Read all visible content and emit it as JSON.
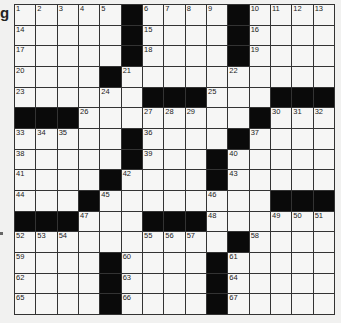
{
  "margin": {
    "text": "g"
  },
  "grid": {
    "rows": 15,
    "cols": 15,
    "layout": [
      "11111011110111 1",
      "x"
    ],
    "pattern": [
      "WWWWW#WWWW#WWWW",
      "WWWWW#WWWW#WWWW",
      "WWWWW#WWWW#WWWW",
      "WWWW#WWWWWWWWWW",
      "WWWWWW###WWW###",
      "###WWWWWWWW#WWW",
      "WWWWW#WWWW#WWWW",
      "WWWWW#WWW#WWWWW",
      "WWWW#WWWW#WWWWW",
      "WWW#WWWWWWWW###",
      "###WWW###WWWWWW",
      "WWWWWWWWWW#WWWW",
      "WWWW#WWWW#WWWWW",
      "WWWW#WWWW#WWWWW",
      "WWWW#WWWW#WWWWW"
    ],
    "numbers": [
      {
        "r": 0,
        "c": 0,
        "n": "1"
      },
      {
        "r": 0,
        "c": 1,
        "n": "2"
      },
      {
        "r": 0,
        "c": 2,
        "n": "3"
      },
      {
        "r": 0,
        "c": 3,
        "n": "4"
      },
      {
        "r": 0,
        "c": 4,
        "n": "5"
      },
      {
        "r": 0,
        "c": 6,
        "n": "6"
      },
      {
        "r": 0,
        "c": 7,
        "n": "7"
      },
      {
        "r": 0,
        "c": 8,
        "n": "8"
      },
      {
        "r": 0,
        "c": 9,
        "n": "9"
      },
      {
        "r": 0,
        "c": 11,
        "n": "10"
      },
      {
        "r": 0,
        "c": 12,
        "n": "11"
      },
      {
        "r": 0,
        "c": 13,
        "n": "12"
      },
      {
        "r": 0,
        "c": 14,
        "n": "13"
      },
      {
        "r": 1,
        "c": 0,
        "n": "14"
      },
      {
        "r": 1,
        "c": 6,
        "n": "15"
      },
      {
        "r": 1,
        "c": 11,
        "n": "16"
      },
      {
        "r": 2,
        "c": 0,
        "n": "17"
      },
      {
        "r": 2,
        "c": 6,
        "n": "18"
      },
      {
        "r": 2,
        "c": 11,
        "n": "19"
      },
      {
        "r": 3,
        "c": 0,
        "n": "20"
      },
      {
        "r": 3,
        "c": 5,
        "n": "21"
      },
      {
        "r": 3,
        "c": 10,
        "n": "22"
      },
      {
        "r": 4,
        "c": 0,
        "n": "23"
      },
      {
        "r": 4,
        "c": 4,
        "n": "24"
      },
      {
        "r": 4,
        "c": 9,
        "n": "25"
      },
      {
        "r": 5,
        "c": 3,
        "n": "26"
      },
      {
        "r": 5,
        "c": 6,
        "n": "27"
      },
      {
        "r": 5,
        "c": 7,
        "n": "28"
      },
      {
        "r": 5,
        "c": 8,
        "n": "29"
      },
      {
        "r": 5,
        "c": 12,
        "n": "30"
      },
      {
        "r": 5,
        "c": 13,
        "n": "31"
      },
      {
        "r": 5,
        "c": 14,
        "n": "32"
      },
      {
        "r": 6,
        "c": 0,
        "n": "33"
      },
      {
        "r": 6,
        "c": 1,
        "n": "34"
      },
      {
        "r": 6,
        "c": 2,
        "n": "35"
      },
      {
        "r": 6,
        "c": 6,
        "n": "36"
      },
      {
        "r": 6,
        "c": 11,
        "n": "37"
      },
      {
        "r": 7,
        "c": 0,
        "n": "38"
      },
      {
        "r": 7,
        "c": 6,
        "n": "39"
      },
      {
        "r": 7,
        "c": 10,
        "n": "40"
      },
      {
        "r": 8,
        "c": 0,
        "n": "41"
      },
      {
        "r": 8,
        "c": 5,
        "n": "42"
      },
      {
        "r": 8,
        "c": 10,
        "n": "43"
      },
      {
        "r": 9,
        "c": 0,
        "n": "44"
      },
      {
        "r": 9,
        "c": 4,
        "n": "45"
      },
      {
        "r": 9,
        "c": 9,
        "n": "46"
      },
      {
        "r": 10,
        "c": 3,
        "n": "47"
      },
      {
        "r": 10,
        "c": 9,
        "n": "48"
      },
      {
        "r": 10,
        "c": 12,
        "n": "49"
      },
      {
        "r": 10,
        "c": 13,
        "n": "50"
      },
      {
        "r": 10,
        "c": 14,
        "n": "51"
      },
      {
        "r": 11,
        "c": 0,
        "n": "52"
      },
      {
        "r": 11,
        "c": 1,
        "n": "53"
      },
      {
        "r": 11,
        "c": 2,
        "n": "54"
      },
      {
        "r": 11,
        "c": 6,
        "n": "55"
      },
      {
        "r": 11,
        "c": 7,
        "n": "56"
      },
      {
        "r": 11,
        "c": 8,
        "n": "57"
      },
      {
        "r": 11,
        "c": 11,
        "n": "58"
      },
      {
        "r": 12,
        "c": 0,
        "n": "59"
      },
      {
        "r": 12,
        "c": 5,
        "n": "60"
      },
      {
        "r": 12,
        "c": 10,
        "n": "61"
      },
      {
        "r": 13,
        "c": 0,
        "n": "62"
      },
      {
        "r": 13,
        "c": 5,
        "n": "63"
      },
      {
        "r": 13,
        "c": 10,
        "n": "64"
      },
      {
        "r": 14,
        "c": 0,
        "n": "65"
      },
      {
        "r": 14,
        "c": 5,
        "n": "66"
      },
      {
        "r": 14,
        "c": 10,
        "n": "67"
      }
    ]
  }
}
